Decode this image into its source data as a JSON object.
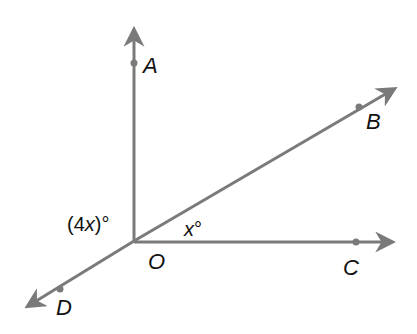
{
  "diagram": {
    "type": "angles-at-point",
    "vertex": {
      "label": "O",
      "x": 134,
      "y": 241
    },
    "rays": [
      {
        "name": "OA",
        "label": "A",
        "tip": [
          134,
          24
        ],
        "point": [
          134,
          63
        ],
        "label_pos": [
          143,
          55
        ]
      },
      {
        "name": "OB",
        "label": "B",
        "tip": [
          400,
          86
        ],
        "point": [
          359,
          107
        ],
        "label_pos": [
          366,
          111
        ]
      },
      {
        "name": "OC",
        "label": "C",
        "tip": [
          399,
          242
        ],
        "point": [
          356,
          242
        ],
        "label_pos": [
          344,
          257
        ]
      },
      {
        "name": "OD",
        "label": "D",
        "tip": [
          22,
          310
        ],
        "point": [
          60,
          289
        ],
        "label_pos": [
          56,
          297
        ]
      }
    ],
    "angles": [
      {
        "between": "AOD",
        "label_prefix": "(4",
        "label_var": "x",
        "label_suffix": ")°"
      },
      {
        "between": "BOC",
        "label_var": "x",
        "label_suffix": "°"
      }
    ],
    "colors": {
      "ray": "#7a7a7a",
      "text": "#111111",
      "background": "#ffffff"
    }
  },
  "labels": {
    "A": "A",
    "B": "B",
    "C": "C",
    "D": "D",
    "O": "O",
    "angle_4x_prefix": "(4",
    "angle_4x_var": "x",
    "angle_4x_suffix": ")°",
    "angle_x_var": "x",
    "angle_x_suffix": "°"
  }
}
